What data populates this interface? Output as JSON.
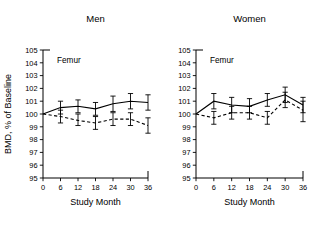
{
  "figure": {
    "width": 319,
    "height": 228,
    "background": "#ffffff",
    "ink_color": "#000000"
  },
  "panels": [
    {
      "key": "men",
      "title": "Men",
      "inner_label": "Femur",
      "xlabel": "Study Month",
      "ylabel": "BMD, % of Baseline",
      "show_ylabel": true
    },
    {
      "key": "women",
      "title": "Women",
      "inner_label": "Femur",
      "xlabel": "Study Month",
      "ylabel": "",
      "show_ylabel": false
    }
  ],
  "axis": {
    "x_ticks": [
      0,
      6,
      12,
      18,
      24,
      30,
      36
    ],
    "x_tick_labels": [
      "0",
      "6",
      "12",
      "18",
      "24",
      "30",
      "36"
    ],
    "y_ticks": [
      95,
      96,
      97,
      98,
      99,
      100,
      101,
      102,
      103,
      104,
      105
    ],
    "y_tick_labels": [
      "95",
      "96",
      "97",
      "98",
      "99",
      "100",
      "101",
      "102",
      "103",
      "104",
      "105"
    ],
    "xlim": [
      0,
      36
    ],
    "ylim": [
      95,
      105
    ],
    "grid": false
  },
  "chart_data": [
    {
      "type": "line",
      "title": "Men",
      "subtitle": "Femur",
      "xlabel": "Study Month",
      "ylabel": "BMD, % of Baseline",
      "xlim": [
        0,
        36
      ],
      "ylim": [
        95,
        105
      ],
      "x": [
        0,
        6,
        12,
        18,
        24,
        30,
        36
      ],
      "x_tick_labels": [
        "0",
        "6",
        "12",
        "18",
        "24",
        "30",
        "36"
      ],
      "y_tick_labels": [
        "95",
        "96",
        "97",
        "98",
        "99",
        "100",
        "101",
        "102",
        "103",
        "104",
        "105"
      ],
      "grid": false,
      "legend": "none",
      "series": [
        {
          "name": "solid-line-group",
          "style": "solid",
          "marker": "none",
          "values": [
            100.0,
            100.5,
            100.6,
            100.4,
            100.8,
            101.0,
            100.9
          ],
          "err_low": [
            100.0,
            100.0,
            100.1,
            99.9,
            100.2,
            100.4,
            100.3
          ],
          "err_high": [
            100.0,
            101.0,
            101.1,
            100.9,
            101.4,
            101.6,
            101.5
          ]
        },
        {
          "name": "dashed-line-group",
          "style": "dashed",
          "marker": "none",
          "values": [
            100.0,
            99.8,
            99.5,
            99.3,
            99.6,
            99.6,
            99.1
          ],
          "err_low": [
            100.0,
            99.3,
            99.1,
            98.8,
            99.1,
            99.1,
            98.5
          ],
          "err_high": [
            100.0,
            100.3,
            100.0,
            99.8,
            100.1,
            100.1,
            99.7
          ]
        }
      ]
    },
    {
      "type": "line",
      "title": "Women",
      "subtitle": "Femur",
      "xlabel": "Study Month",
      "ylabel": "",
      "xlim": [
        0,
        36
      ],
      "ylim": [
        95,
        105
      ],
      "x": [
        0,
        6,
        12,
        18,
        24,
        30,
        36
      ],
      "x_tick_labels": [
        "0",
        "6",
        "12",
        "18",
        "24",
        "30",
        "36"
      ],
      "y_tick_labels": [
        "95",
        "96",
        "97",
        "98",
        "99",
        "100",
        "101",
        "102",
        "103",
        "104",
        "105"
      ],
      "grid": false,
      "legend": "none",
      "series": [
        {
          "name": "solid-line-group",
          "style": "solid",
          "marker": "none",
          "values": [
            100.0,
            101.0,
            100.7,
            100.6,
            101.1,
            101.5,
            100.7
          ],
          "err_low": [
            100.0,
            100.4,
            100.1,
            100.1,
            100.6,
            100.9,
            100.1
          ],
          "err_high": [
            100.0,
            101.6,
            101.3,
            101.2,
            101.6,
            102.1,
            101.3
          ]
        },
        {
          "name": "dashed-line-group",
          "style": "dashed",
          "marker": "none",
          "values": [
            100.0,
            99.7,
            100.1,
            100.1,
            99.7,
            101.1,
            100.3
          ],
          "err_low": [
            100.0,
            99.2,
            99.6,
            99.6,
            99.2,
            100.5,
            99.4
          ],
          "err_high": [
            100.0,
            100.2,
            100.6,
            100.6,
            100.2,
            101.7,
            101.0
          ]
        }
      ]
    }
  ]
}
